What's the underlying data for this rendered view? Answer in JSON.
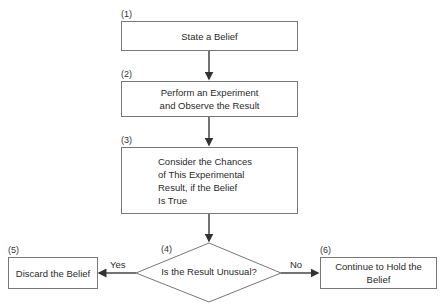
{
  "diagram": {
    "type": "flowchart",
    "nodes": [
      {
        "id": "1",
        "number": "(1)",
        "label": "State a Belief",
        "shape": "rectangle"
      },
      {
        "id": "2",
        "number": "(2)",
        "label": "Perform an Experiment\nand Observe the Result",
        "shape": "rectangle"
      },
      {
        "id": "3",
        "number": "(3)",
        "label": "Consider the Chances\nof This Experimental\nResult, if the Belief\nIs True",
        "shape": "rectangle"
      },
      {
        "id": "4",
        "number": "(4)",
        "label": "Is the Result Unusual?",
        "shape": "diamond"
      },
      {
        "id": "5",
        "number": "(5)",
        "label": "Discard the Belief",
        "shape": "rectangle"
      },
      {
        "id": "6",
        "number": "(6)",
        "label": "Continue to Hold the\nBelief",
        "shape": "rectangle"
      }
    ],
    "edges": [
      {
        "from": "1",
        "to": "2",
        "label": ""
      },
      {
        "from": "2",
        "to": "3",
        "label": ""
      },
      {
        "from": "3",
        "to": "4",
        "label": ""
      },
      {
        "from": "4",
        "to": "5",
        "label": "Yes"
      },
      {
        "from": "4",
        "to": "6",
        "label": "No"
      }
    ],
    "colors": {
      "line": "#444444",
      "border": "#777777",
      "text": "#2a2a2a"
    }
  }
}
